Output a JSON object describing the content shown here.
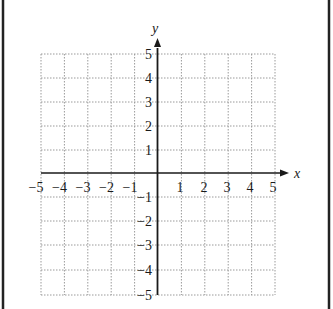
{
  "diagram": {
    "type": "coordinate-grid",
    "x_axis": {
      "label": "x",
      "min": -5,
      "max": 5,
      "tick_labels_negative": [
        "−5",
        "−4",
        "−3",
        "−2",
        "−1"
      ],
      "tick_labels_positive": [
        "1",
        "2",
        "3",
        "4",
        "5"
      ]
    },
    "y_axis": {
      "label": "y",
      "min": -5,
      "max": 5,
      "tick_labels_positive": [
        "5",
        "4",
        "3",
        "2",
        "1"
      ],
      "tick_labels_negative": [
        "−1",
        "−2",
        "−3",
        "−4",
        "−5"
      ]
    },
    "grid": {
      "style": "dotted",
      "step": 1
    },
    "colors": {
      "axis": "#1a1a1a",
      "grid": "#9a9a9a",
      "frame": "#222222",
      "background": "#ffffff"
    }
  }
}
